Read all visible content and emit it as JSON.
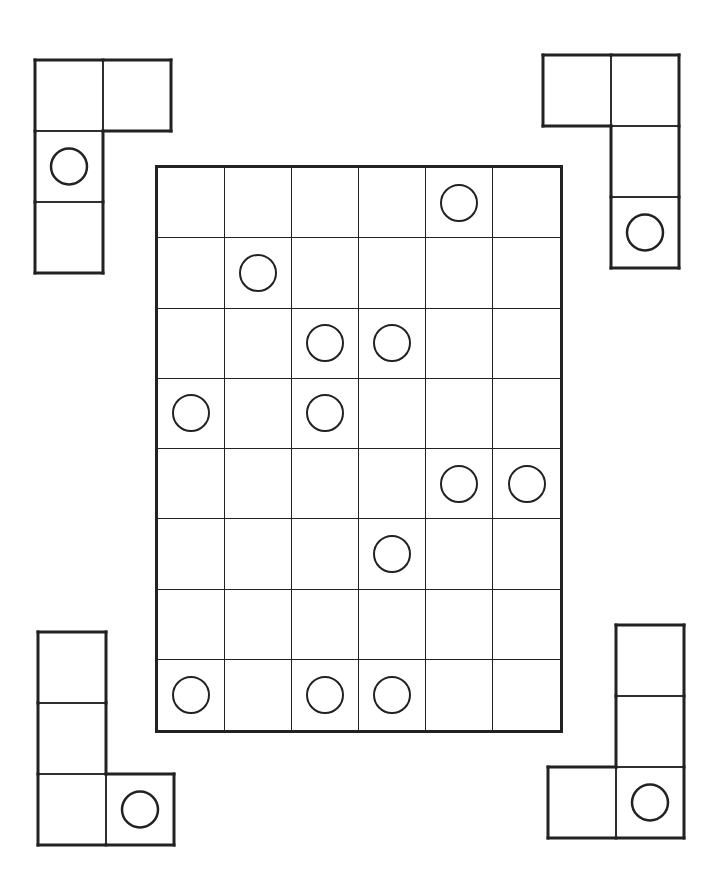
{
  "puzzle": {
    "board": {
      "rows": 8,
      "cols": 6,
      "circles": [
        [
          0,
          4
        ],
        [
          1,
          1
        ],
        [
          2,
          2
        ],
        [
          2,
          3
        ],
        [
          3,
          0
        ],
        [
          3,
          2
        ],
        [
          4,
          4
        ],
        [
          4,
          5
        ],
        [
          5,
          3
        ],
        [
          7,
          0
        ],
        [
          7,
          2
        ],
        [
          7,
          3
        ]
      ]
    },
    "pieces": [
      {
        "id": "top-left",
        "left": 35,
        "top": 60,
        "cells": [
          [
            0,
            0
          ],
          [
            0,
            1
          ],
          [
            1,
            0
          ],
          [
            2,
            0
          ]
        ],
        "circle": [
          1,
          0
        ]
      },
      {
        "id": "top-right",
        "left": 543,
        "top": 55,
        "cells": [
          [
            0,
            0
          ],
          [
            0,
            1
          ],
          [
            1,
            1
          ],
          [
            2,
            1
          ]
        ],
        "circle": [
          2,
          1
        ]
      },
      {
        "id": "bottom-left",
        "left": 38,
        "top": 632,
        "cells": [
          [
            0,
            0
          ],
          [
            1,
            0
          ],
          [
            2,
            0
          ],
          [
            2,
            1
          ]
        ],
        "circle": [
          2,
          1
        ]
      },
      {
        "id": "bottom-right",
        "left": 548,
        "top": 625,
        "cells": [
          [
            0,
            1
          ],
          [
            1,
            1
          ],
          [
            2,
            0
          ],
          [
            2,
            1
          ]
        ],
        "circle": [
          2,
          1
        ]
      }
    ],
    "colors": {
      "line": "#222222",
      "background": "#ffffff"
    }
  }
}
